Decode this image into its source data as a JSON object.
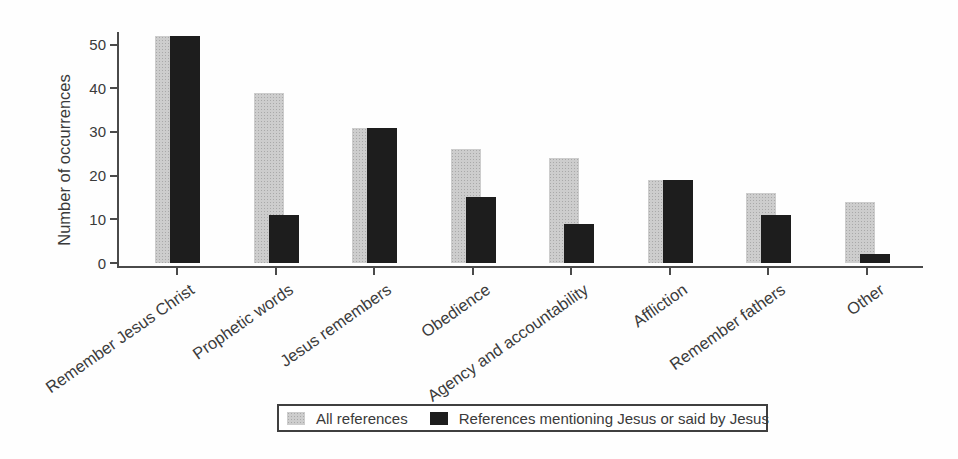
{
  "figure": {
    "title": "",
    "ylabel": "Number of occurrences"
  },
  "colors": {
    "bar_all_references": "#c9c9c9",
    "bar_jesus_references": "#1d1d1d",
    "text": "#3a3a3a",
    "axis": "#4a4a4a",
    "background": "#fefefe"
  },
  "chart_data": {
    "type": "bar",
    "style": "overlapping-grouped-bars",
    "title": "",
    "xlabel": "",
    "ylabel": "Number of occurrences",
    "categories": [
      "Remember Jesus Christ",
      "Prophetic words",
      "Jesus remembers",
      "Obedience",
      "Agency and accountability",
      "Affliction",
      "Remember fathers",
      "Other"
    ],
    "series": [
      {
        "name": "All references",
        "color": "#c9c9c9",
        "values": [
          52,
          39,
          31,
          26,
          24,
          19,
          16,
          14
        ]
      },
      {
        "name": "References mentioning Jesus or said by Jesus",
        "color": "#1d1d1d",
        "values": [
          52,
          11,
          31,
          15,
          9,
          19,
          11,
          2
        ]
      }
    ],
    "yticks": [
      0,
      10,
      20,
      30,
      40,
      50
    ],
    "ylim": [
      0,
      55
    ],
    "grid": false,
    "legend_position": "bottom-center"
  },
  "legend": {
    "entries": [
      {
        "label": "All references"
      },
      {
        "label": "References mentioning Jesus or said by Jesus"
      }
    ]
  }
}
